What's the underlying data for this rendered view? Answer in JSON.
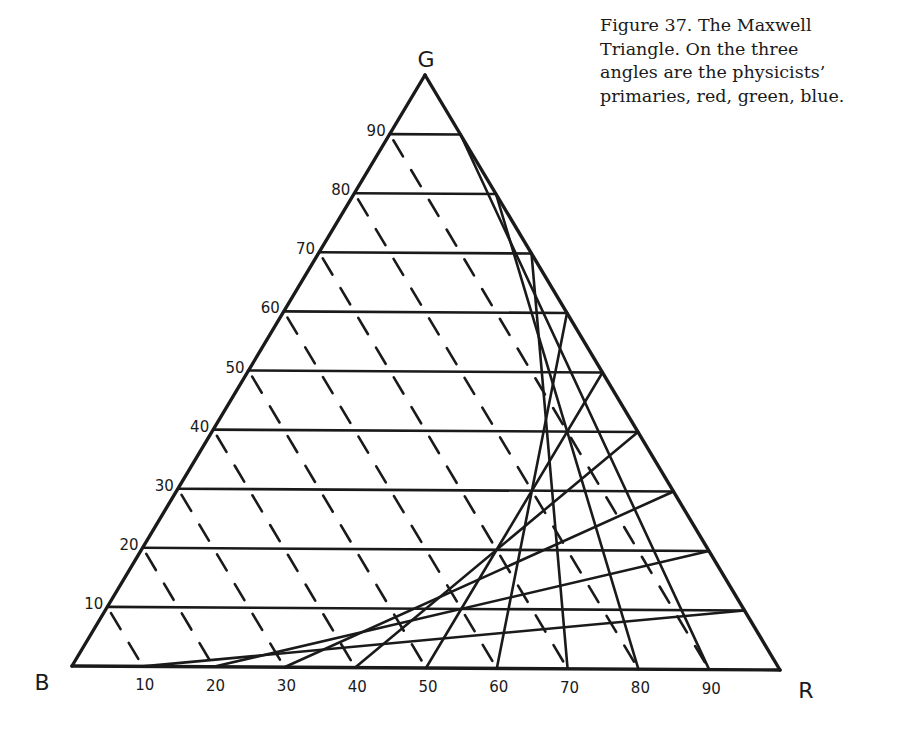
{
  "caption": {
    "lines": [
      "Figure 37. The Maxwell",
      "Triangle. On the three",
      "angles are the physicists’",
      "primaries, red, green, blue."
    ]
  },
  "chart_data": {
    "type": "ternary-diagram",
    "title": "The Maxwell Triangle",
    "vertices": [
      {
        "label": "B",
        "name": "blue",
        "x": 72,
        "y": 666
      },
      {
        "label": "R",
        "name": "red",
        "x": 780,
        "y": 670
      },
      {
        "label": "G",
        "name": "green",
        "x": 425,
        "y": 75
      }
    ],
    "divisions": 10,
    "left_axis_ticks": [
      "10",
      "20",
      "30",
      "40",
      "50",
      "60",
      "70",
      "80",
      "90"
    ],
    "bottom_axis_ticks": [
      "10",
      "20",
      "30",
      "40",
      "50",
      "60",
      "70",
      "80",
      "90"
    ],
    "grid": {
      "horizontal_lines": "solid",
      "lines_parallel_to_BG_edge": "solid",
      "lines_parallel_to_RG_edge": "dashed"
    },
    "line_color": "#1a1a1a"
  }
}
